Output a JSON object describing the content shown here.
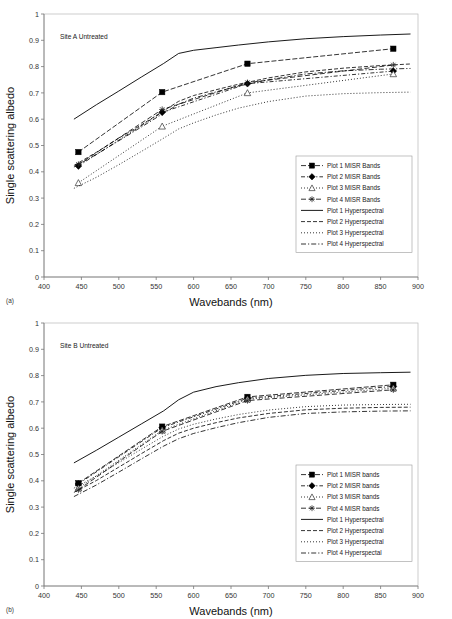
{
  "figure": {
    "panels": [
      {
        "id": "panel-a",
        "label": "(a)",
        "annotation": "Site A Untreated"
      },
      {
        "id": "panel-b",
        "label": "(b)",
        "annotation": "Site B Untreated"
      }
    ]
  },
  "chart_data": [
    {
      "type": "line",
      "title": "Site A Untreated",
      "panel_label": "(a)",
      "xlabel": "Wavebands (nm)",
      "ylabel": "Single scattering albedo",
      "xlim": [
        400,
        900
      ],
      "ylim": [
        0,
        1
      ],
      "xticks": [
        400,
        450,
        500,
        550,
        600,
        650,
        700,
        750,
        800,
        850,
        900
      ],
      "yticks": [
        0,
        0.1,
        0.2,
        0.3,
        0.4,
        0.5,
        0.6,
        0.7,
        0.8,
        0.9,
        1
      ],
      "grid": false,
      "legend_position": "right-middle",
      "series": [
        {
          "name": "Plot 1 MISR Bands",
          "style": "marker-line",
          "marker": "filled-square",
          "dash": "5,2",
          "x": [
            446,
            558,
            672,
            867
          ],
          "values": [
            0.475,
            0.703,
            0.811,
            0.868
          ]
        },
        {
          "name": "Plot 2 MISR Bands",
          "style": "marker-line",
          "marker": "filled-diamond",
          "dash": "4,2,1.2,2",
          "x": [
            446,
            558,
            672,
            867
          ],
          "values": [
            0.422,
            0.626,
            0.735,
            0.783
          ]
        },
        {
          "name": "Plot 3 MISR Bands",
          "style": "marker-line",
          "marker": "open-triangle",
          "dash": "1,2",
          "x": [
            446,
            558,
            672,
            867
          ],
          "values": [
            0.358,
            0.573,
            0.7,
            0.772
          ]
        },
        {
          "name": "Plot 4 MISR Bands",
          "style": "marker-line",
          "marker": "cross-star",
          "dash": "5,2.5",
          "x": [
            446,
            558,
            672,
            867
          ],
          "values": [
            0.428,
            0.637,
            0.739,
            0.806
          ]
        },
        {
          "name": "Plot 1 Hyperspectral",
          "style": "line",
          "dash": "none",
          "x": [
            440,
            470,
            500,
            530,
            560,
            580,
            600,
            630,
            660,
            700,
            750,
            800,
            850,
            890
          ],
          "values": [
            0.6,
            0.655,
            0.707,
            0.76,
            0.812,
            0.85,
            0.862,
            0.872,
            0.882,
            0.894,
            0.906,
            0.914,
            0.92,
            0.924
          ]
        },
        {
          "name": "Plot 2 Hyperspectral",
          "style": "line",
          "dash": "4,2",
          "x": [
            440,
            470,
            500,
            530,
            560,
            580,
            600,
            630,
            660,
            700,
            750,
            800,
            850,
            890
          ],
          "values": [
            0.424,
            0.474,
            0.528,
            0.578,
            0.632,
            0.668,
            0.69,
            0.712,
            0.733,
            0.757,
            0.78,
            0.794,
            0.804,
            0.81
          ]
        },
        {
          "name": "Plot 3 Hyperspectral",
          "style": "line",
          "dash": "1,2",
          "x": [
            440,
            470,
            500,
            530,
            560,
            580,
            600,
            630,
            660,
            700,
            750,
            800,
            850,
            890
          ],
          "values": [
            0.337,
            0.379,
            0.427,
            0.477,
            0.528,
            0.563,
            0.586,
            0.616,
            0.642,
            0.667,
            0.688,
            0.697,
            0.701,
            0.703
          ]
        },
        {
          "name": "Plot 4 Hyperspectral",
          "style": "line",
          "dash": "5,2,1.2,2",
          "x": [
            440,
            470,
            500,
            530,
            560,
            580,
            600,
            630,
            660,
            700,
            750,
            800,
            850,
            890
          ],
          "values": [
            0.418,
            0.466,
            0.518,
            0.57,
            0.623,
            0.657,
            0.68,
            0.704,
            0.726,
            0.75,
            0.772,
            0.784,
            0.79,
            0.793
          ]
        }
      ]
    },
    {
      "type": "line",
      "title": "Site B Untreated",
      "panel_label": "(b)",
      "xlabel": "Wavebands (nm)",
      "ylabel": "Single scattering albedo",
      "xlim": [
        400,
        900
      ],
      "ylim": [
        0,
        1
      ],
      "xticks": [
        400,
        450,
        500,
        550,
        600,
        650,
        700,
        750,
        800,
        850,
        900
      ],
      "yticks": [
        0,
        0.1,
        0.2,
        0.3,
        0.4,
        0.5,
        0.6,
        0.7,
        0.8,
        0.9,
        1
      ],
      "grid": false,
      "legend_position": "right-middle",
      "series": [
        {
          "name": "Plot 1 MISR bands",
          "style": "marker-line",
          "marker": "filled-square",
          "dash": "5,2",
          "x": [
            446,
            558,
            672,
            867
          ],
          "values": [
            0.391,
            0.606,
            0.719,
            0.765
          ]
        },
        {
          "name": "Plot 2 MISR bands",
          "style": "marker-line",
          "marker": "filled-diamond",
          "dash": "4,2,1.2,2",
          "x": [
            446,
            558,
            672,
            867
          ],
          "values": [
            0.388,
            0.602,
            0.714,
            0.759
          ]
        },
        {
          "name": "Plot 3 MISR bands",
          "style": "marker-line",
          "marker": "open-triangle",
          "dash": "1,2",
          "x": [
            446,
            558,
            672,
            867
          ],
          "values": [
            0.372,
            0.592,
            0.71,
            0.752
          ]
        },
        {
          "name": "Plot 4 MISR bands",
          "style": "marker-line",
          "marker": "cross-star",
          "dash": "5,2.5",
          "x": [
            446,
            558,
            672,
            867
          ],
          "values": [
            0.366,
            0.588,
            0.705,
            0.746
          ]
        },
        {
          "name": "Plot 1 Hyperspectral",
          "style": "line",
          "dash": "none",
          "x": [
            440,
            470,
            500,
            530,
            560,
            580,
            600,
            630,
            660,
            700,
            750,
            800,
            850,
            890
          ],
          "values": [
            0.468,
            0.516,
            0.566,
            0.616,
            0.666,
            0.708,
            0.737,
            0.758,
            0.773,
            0.789,
            0.801,
            0.808,
            0.811,
            0.813
          ]
        },
        {
          "name": "Plot 2 Hyperspectral",
          "style": "line",
          "dash": "4,2",
          "x": [
            440,
            470,
            500,
            530,
            560,
            580,
            600,
            630,
            660,
            700,
            750,
            800,
            850,
            890
          ],
          "values": [
            0.356,
            0.401,
            0.452,
            0.503,
            0.553,
            0.581,
            0.6,
            0.621,
            0.639,
            0.656,
            0.67,
            0.676,
            0.679,
            0.68
          ]
        },
        {
          "name": "Plot 3 Hyperspectral",
          "style": "line",
          "dash": "1,2",
          "x": [
            440,
            470,
            500,
            530,
            560,
            580,
            600,
            630,
            660,
            700,
            750,
            800,
            850,
            890
          ],
          "values": [
            0.372,
            0.418,
            0.469,
            0.52,
            0.57,
            0.597,
            0.615,
            0.635,
            0.652,
            0.669,
            0.682,
            0.688,
            0.69,
            0.691
          ]
        },
        {
          "name": "Plot 4 Hyperspectal",
          "style": "line",
          "dash": "5,2,1.2,2",
          "x": [
            440,
            470,
            500,
            530,
            560,
            580,
            600,
            630,
            660,
            700,
            750,
            800,
            850,
            890
          ],
          "values": [
            0.34,
            0.384,
            0.433,
            0.483,
            0.532,
            0.56,
            0.58,
            0.602,
            0.621,
            0.641,
            0.656,
            0.662,
            0.665,
            0.666
          ]
        }
      ]
    }
  ]
}
